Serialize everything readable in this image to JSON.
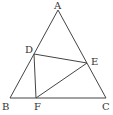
{
  "diagram": {
    "type": "geometry-triangle",
    "points": {
      "A": {
        "label": "A",
        "x": 58,
        "y": 10
      },
      "B": {
        "label": "B",
        "x": 10,
        "y": 98
      },
      "C": {
        "label": "C",
        "x": 106,
        "y": 98
      },
      "D": {
        "label": "D",
        "x": 34,
        "y": 54
      },
      "E": {
        "label": "E",
        "x": 87,
        "y": 63
      },
      "F": {
        "label": "F",
        "x": 36,
        "y": 98
      }
    },
    "segments": [
      [
        "A",
        "B"
      ],
      [
        "A",
        "C"
      ],
      [
        "B",
        "C"
      ],
      [
        "D",
        "E"
      ],
      [
        "D",
        "F"
      ],
      [
        "E",
        "F"
      ]
    ],
    "line_color": "#444444",
    "label_color": "#333333"
  }
}
